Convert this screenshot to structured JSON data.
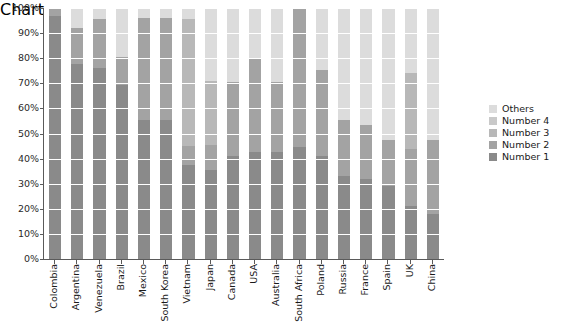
{
  "chart_data": {
    "type": "bar",
    "subtype": "100% stacked bar",
    "title": "",
    "xlabel": "",
    "ylabel": "",
    "ylim": [
      0,
      100
    ],
    "ytick_labels": [
      "0%",
      "10%",
      "20%",
      "30%",
      "40%",
      "50%",
      "60%",
      "70%",
      "80%",
      "90%",
      "100%"
    ],
    "ytick_values": [
      0,
      10,
      20,
      30,
      40,
      50,
      60,
      70,
      80,
      90,
      100
    ],
    "grid": true,
    "legend_position": "right",
    "categories": [
      "Colombia",
      "Argentina",
      "Venezuela",
      "Brazil",
      "Mexico",
      "South Korea",
      "Vietnam",
      "Japan",
      "Canada",
      "USA",
      "Australia",
      "South Africa",
      "Poland",
      "Russia",
      "France",
      "Spain",
      "UK",
      "China"
    ],
    "series": [
      {
        "name": "Number 1",
        "color": "#8a8a8a",
        "values": [
          97,
          77.5,
          76,
          69.5,
          55.5,
          55.5,
          37.5,
          35.5,
          41,
          42.5,
          42.5,
          44.5,
          41,
          33,
          32,
          29,
          21,
          18
        ]
      },
      {
        "name": "Number 2",
        "color": "#a3a3a3",
        "values": [
          3,
          14.5,
          19.5,
          11,
          40.5,
          40.5,
          7.5,
          10,
          29.5,
          37.5,
          28,
          55.5,
          34.5,
          22.5,
          21.5,
          18.5,
          23,
          29.5
        ]
      },
      {
        "name": "Number 3",
        "color": "#b8b8b8",
        "values": [
          0,
          0,
          0,
          0,
          0,
          0,
          50.5,
          25.5,
          0,
          0,
          0,
          0,
          0,
          0,
          0,
          0,
          30,
          0
        ]
      },
      {
        "name": "Number 4",
        "color": "#c9c9c9",
        "values": [
          0,
          0,
          0,
          0,
          0,
          0,
          0,
          0,
          0,
          0,
          0,
          0,
          0,
          0,
          0,
          0,
          0,
          0
        ]
      },
      {
        "name": "Others",
        "color": "#dcdcdc",
        "values": [
          0,
          8,
          4.5,
          19.5,
          4,
          4,
          4.5,
          29,
          29.5,
          20,
          29.5,
          0,
          24.5,
          44.5,
          46.5,
          52.5,
          26,
          52.5
        ]
      }
    ],
    "legend_entries": [
      {
        "label": "Others",
        "color": "#dcdcdc"
      },
      {
        "label": "Number 4",
        "color": "#c9c9c9"
      },
      {
        "label": "Number 3",
        "color": "#b8b8b8"
      },
      {
        "label": "Number 2",
        "color": "#a3a3a3"
      },
      {
        "label": "Number 1",
        "color": "#8a8a8a"
      }
    ]
  },
  "colors": {
    "axis": "#5a5a5a",
    "gridline": "#ffffff",
    "text": "#1a1a1a",
    "background": "#ffffff"
  }
}
